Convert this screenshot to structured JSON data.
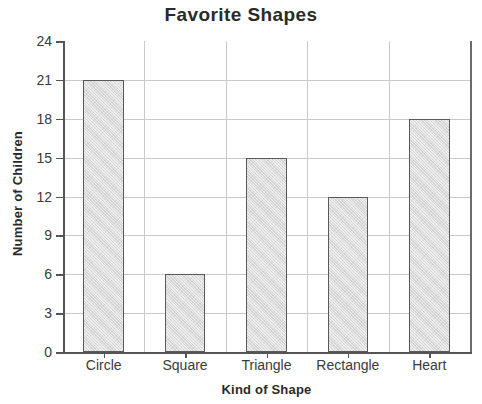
{
  "chart_data": {
    "type": "bar",
    "title": "Favorite Shapes",
    "xlabel": "Kind of Shape",
    "ylabel": "Number of Children",
    "categories": [
      "Circle",
      "Square",
      "Triangle",
      "Rectangle",
      "Heart"
    ],
    "values": [
      21,
      6,
      15,
      12,
      18
    ],
    "ylim": [
      0,
      24
    ],
    "ytick_step": 3,
    "yticks": [
      0,
      3,
      6,
      9,
      12,
      15,
      18,
      21,
      24
    ],
    "ytick_labels": [
      "0",
      "3",
      "6",
      "9",
      "12",
      "15",
      "18",
      "21",
      "24"
    ],
    "grid": true,
    "grid_axes": "both",
    "legend": "none",
    "bar_fill_color": "#d9d9d9",
    "bar_border_color": "#5a5a5a",
    "grid_color": "#c9c9c9",
    "axis_color": "#555555",
    "text_color": "#2a2a2a",
    "background_color": "#ffffff"
  }
}
